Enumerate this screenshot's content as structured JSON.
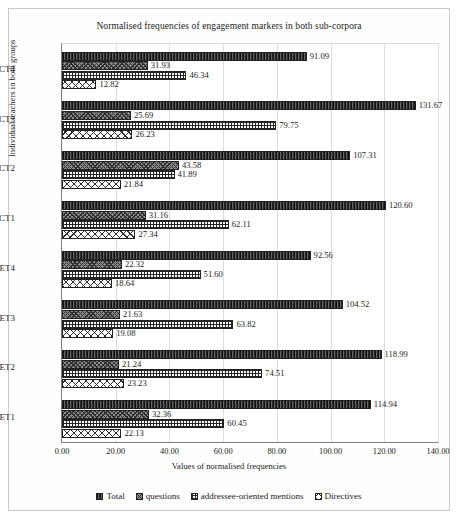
{
  "chart_data": {
    "type": "bar",
    "orientation": "horizontal",
    "title": "Normalised frequencies of engagement markers in both sub-corpora",
    "xlabel": "Values of normalised frequencies",
    "ylabel": "Individual teachers in both groups",
    "xlim": [
      0,
      140
    ],
    "xticks": [
      "0.00",
      "20.00",
      "40.00",
      "60.00",
      "80.00",
      "100.00",
      "120.00",
      "140.00"
    ],
    "xtick_values": [
      0,
      20,
      40,
      60,
      80,
      100,
      120,
      140
    ],
    "grid": true,
    "legend_position": "bottom",
    "categories": [
      "ET1",
      "ET2",
      "ET3",
      "ET4",
      "CT1",
      "CT2",
      "CT3",
      "CT4"
    ],
    "series": [
      {
        "name": "Total",
        "fill": "f-total",
        "values": [
          114.94,
          118.99,
          104.52,
          92.56,
          120.6,
          107.31,
          131.67,
          91.09
        ],
        "labels": [
          "114.94",
          "118.99",
          "104.52",
          "92.56",
          "120.60",
          "107.31",
          "131.67",
          "91.09"
        ]
      },
      {
        "name": "questions",
        "fill": "f-questions",
        "values": [
          32.36,
          21.24,
          21.63,
          22.32,
          31.16,
          43.58,
          25.69,
          31.93
        ],
        "labels": [
          "32.36",
          "21.24",
          "21.63",
          "22.32",
          "31.16",
          "43.58",
          "25.69",
          "31.93"
        ]
      },
      {
        "name": "addressee-oriented mentions",
        "fill": "f-addressee",
        "values": [
          60.45,
          74.51,
          63.82,
          51.6,
          62.11,
          41.89,
          79.75,
          46.34
        ],
        "labels": [
          "60.45",
          "74.51",
          "63.82",
          "51.60",
          "62.11",
          "41.89",
          "79.75",
          "46.34"
        ]
      },
      {
        "name": "Directives",
        "fill": "f-directives",
        "values": [
          22.13,
          23.23,
          19.08,
          18.64,
          27.34,
          21.84,
          26.23,
          12.82
        ],
        "labels": [
          "22.13",
          "23.23",
          "19.08",
          "18.64",
          "27.34",
          "21.84",
          "26.23",
          "12.82"
        ]
      }
    ]
  },
  "legend": [
    {
      "label": "Total",
      "fill": "f-total"
    },
    {
      "label": "questions",
      "fill": "f-questions"
    },
    {
      "label": "addressee-oriented mentions",
      "fill": "f-addressee"
    },
    {
      "label": "Directives",
      "fill": "f-directives"
    }
  ]
}
